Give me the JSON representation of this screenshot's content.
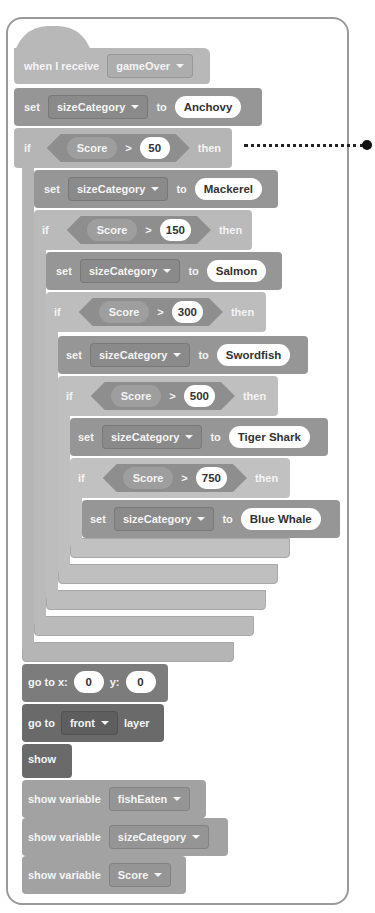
{
  "script": {
    "hat": {
      "label": "when I receive",
      "message": "gameOver"
    },
    "initial_set": {
      "set_label": "set",
      "variable": "sizeCategory",
      "to_label": "to",
      "value": "Anchovy"
    },
    "if_blocks": [
      {
        "if_label": "if",
        "reporter": "Score",
        "operator": ">",
        "threshold": "50",
        "then_label": "then",
        "set_label": "set",
        "variable": "sizeCategory",
        "to_label": "to",
        "value": "Mackerel"
      },
      {
        "if_label": "if",
        "reporter": "Score",
        "operator": ">",
        "threshold": "150",
        "then_label": "then",
        "set_label": "set",
        "variable": "sizeCategory",
        "to_label": "to",
        "value": "Salmon"
      },
      {
        "if_label": "if",
        "reporter": "Score",
        "operator": ">",
        "threshold": "300",
        "then_label": "then",
        "set_label": "set",
        "variable": "sizeCategory",
        "to_label": "to",
        "value": "Swordfish"
      },
      {
        "if_label": "if",
        "reporter": "Score",
        "operator": ">",
        "threshold": "500",
        "then_label": "then",
        "set_label": "set",
        "variable": "sizeCategory",
        "to_label": "to",
        "value": "Tiger Shark"
      },
      {
        "if_label": "if",
        "reporter": "Score",
        "operator": ">",
        "threshold": "750",
        "then_label": "then",
        "set_label": "set",
        "variable": "sizeCategory",
        "to_label": "to",
        "value": "Blue Whale"
      }
    ],
    "goto_xy": {
      "label": "go to x:",
      "x": "0",
      "y_label": "y:",
      "y": "0"
    },
    "goto_layer": {
      "label": "go to",
      "layer": "front",
      "suffix": "layer"
    },
    "show": {
      "label": "show"
    },
    "show_variables": [
      {
        "label": "show variable",
        "variable": "fishEaten"
      },
      {
        "label": "show variable",
        "variable": "sizeCategory"
      },
      {
        "label": "show variable",
        "variable": "Score"
      }
    ]
  },
  "colors": {
    "control": "#b5b5b5",
    "variable": "#969696",
    "motion": "#7c7c7c",
    "looks": "#6a6a6a",
    "panel_border": "#9a9a9a"
  }
}
